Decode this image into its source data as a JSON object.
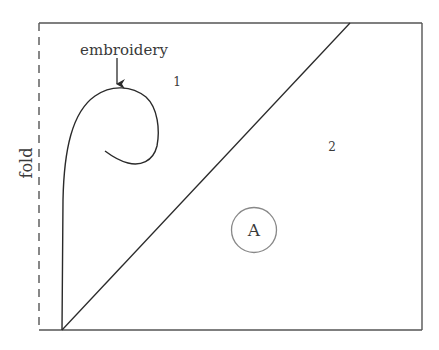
{
  "diagram": {
    "labels": {
      "embroidery": "embroidery",
      "fold": "fold",
      "region_1": "1",
      "region_2": "2",
      "circle_marker": "A"
    },
    "colors": {
      "line": "#2a2a2a",
      "frame": "#555555",
      "circle": "#888888",
      "text": "#3a3a3a",
      "background": "#ffffff"
    },
    "elements": [
      {
        "id": "frame",
        "type": "rectangle",
        "left_edge": "dashed (fold)",
        "other_edges": "solid"
      },
      {
        "id": "diagonal",
        "type": "line",
        "from": "bottom-left",
        "to": "top edge near right"
      },
      {
        "id": "embroidery-curve",
        "type": "spiral curve",
        "region": "1"
      },
      {
        "id": "embroidery-arrow",
        "type": "arrow",
        "points_to": "embroidery-curve"
      },
      {
        "id": "circle-a",
        "type": "circle",
        "label": "A",
        "region": "2"
      }
    ]
  }
}
